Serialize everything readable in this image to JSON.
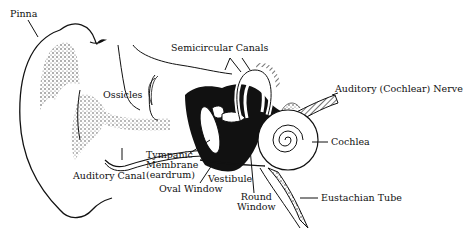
{
  "diagram": {
    "labels": {
      "pinna": "Pinna",
      "ossicles": "Ossicles",
      "semicircular_canals": "Semicircular Canals",
      "auditory_nerve": "Auditory (Cochlear) Nerve",
      "cochlea": "Cochlea",
      "auditory_canal": "Auditory Canal",
      "tympanic_line1": "Tympanic",
      "tympanic_line2": "Membrane",
      "tympanic_line3": "(eardrum)",
      "vestibule": "Vestibule",
      "oval_window": "Oval Window",
      "round_window_line1": "Round",
      "round_window_line2": "Window",
      "eustachian_tube": "Eustachian Tube"
    },
    "colors": {
      "ink": "#111111",
      "background": "#ffffff"
    }
  }
}
